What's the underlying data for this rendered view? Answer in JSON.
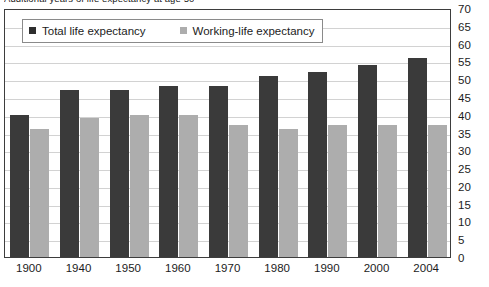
{
  "chart_data": {
    "type": "bar",
    "title": "Additional years of life expectancy at age 50",
    "xlabel": "",
    "ylabel": "",
    "ylim": [
      0,
      70
    ],
    "ytick_step": 5,
    "yticks": [
      70,
      65,
      60,
      55,
      50,
      45,
      40,
      35,
      30,
      25,
      20,
      15,
      10,
      5,
      0
    ],
    "grid": true,
    "y_axis_position": "right",
    "legend_position": "top-left",
    "categories": [
      "1900",
      "1940",
      "1950",
      "1960",
      "1970",
      "1980",
      "1990",
      "2000",
      "2004"
    ],
    "series": [
      {
        "name": "Total life expectancy",
        "color": "#3a3a3a",
        "values": [
          40,
          47,
          47,
          48,
          48,
          51,
          52,
          54,
          56
        ]
      },
      {
        "name": "Working-life expectancy",
        "color": "#adadad",
        "values": [
          36,
          39,
          40,
          40,
          37,
          36,
          37,
          37,
          37
        ]
      }
    ]
  },
  "legend": {
    "items": [
      {
        "label": "Total life expectancy",
        "swatch": "total"
      },
      {
        "label": "Working-life expectancy",
        "swatch": "working"
      }
    ]
  },
  "colors": {
    "total_bar": "#3a3a3a",
    "working_bar": "#adadad",
    "gridline": "#d2d2d2",
    "frame": "#3d3d3d",
    "text": "#1c1c1c"
  }
}
